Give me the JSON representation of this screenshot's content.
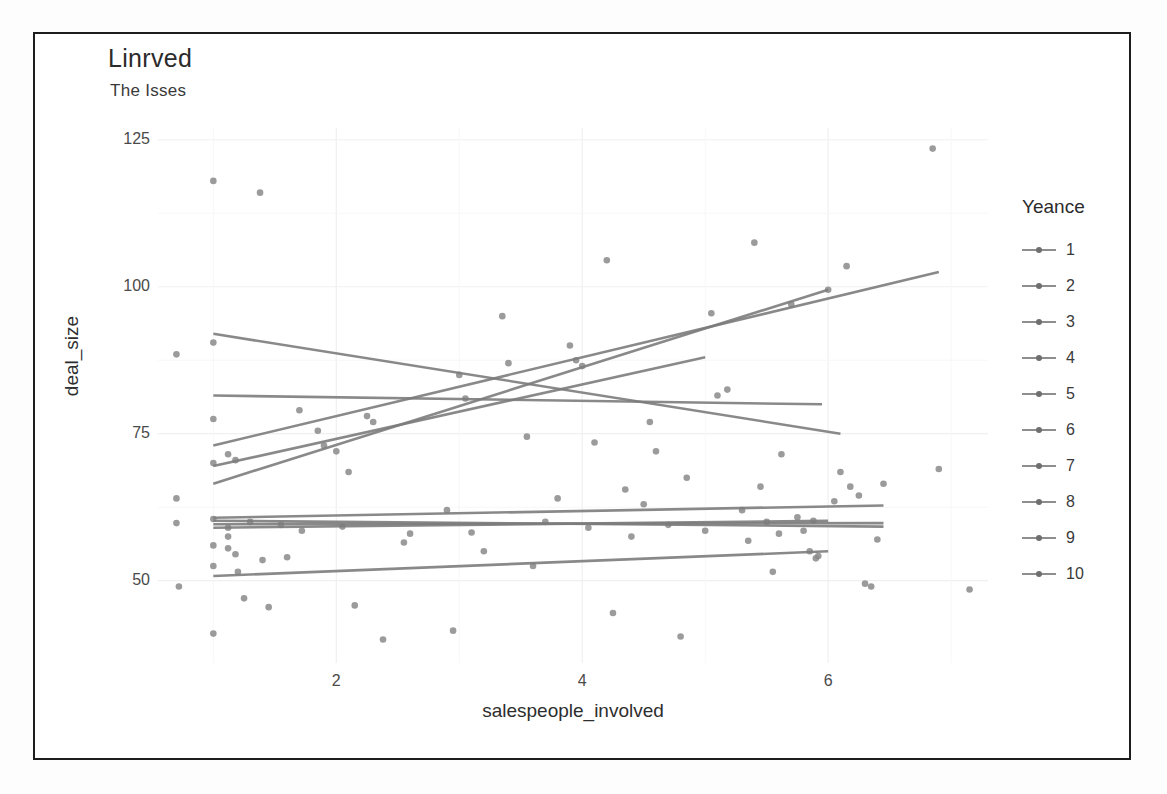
{
  "chart_data": {
    "type": "scatter",
    "title": "Linrved",
    "subtitle": "The Isses",
    "xlabel": "salespeople_involved",
    "ylabel": "deal_size",
    "xlim": [
      0.55,
      7.3
    ],
    "ylim": [
      36,
      127
    ],
    "xticks": [
      2,
      4,
      6
    ],
    "yticks": [
      50,
      75,
      100,
      125
    ],
    "grid": true,
    "legend_title": "Yeance",
    "legend_position": "right",
    "legend_entries": [
      "1",
      "2",
      "3",
      "4",
      "5",
      "6",
      "7",
      "8",
      "9",
      "10"
    ],
    "point_color": "#8a8a8a",
    "line_color": "#7c7c7c",
    "grid_color": "#f0f0f0",
    "panel_background": "#ffffff",
    "series": [
      {
        "name": "1",
        "fit": {
          "x0": 1.0,
          "y0": 92.0,
          "x1": 6.1,
          "y1": 75.0
        }
      },
      {
        "name": "2",
        "fit": {
          "x0": 1.0,
          "y0": 81.5,
          "x1": 5.95,
          "y1": 80.0
        }
      },
      {
        "name": "3",
        "fit": {
          "x0": 1.0,
          "y0": 73.0,
          "x1": 6.9,
          "y1": 102.5
        }
      },
      {
        "name": "4",
        "fit": {
          "x0": 1.0,
          "y0": 69.5,
          "x1": 5.0,
          "y1": 88.0
        }
      },
      {
        "name": "5",
        "fit": {
          "x0": 1.0,
          "y0": 66.5,
          "x1": 6.0,
          "y1": 99.5
        }
      },
      {
        "name": "6",
        "fit": {
          "x0": 1.0,
          "y0": 60.7,
          "x1": 6.45,
          "y1": 62.8
        }
      },
      {
        "name": "7",
        "fit": {
          "x0": 1.0,
          "y0": 60.2,
          "x1": 6.45,
          "y1": 59.2
        }
      },
      {
        "name": "8",
        "fit": {
          "x0": 1.0,
          "y0": 59.6,
          "x1": 6.45,
          "y1": 59.8
        }
      },
      {
        "name": "9",
        "fit": {
          "x0": 1.0,
          "y0": 59.0,
          "x1": 6.0,
          "y1": 60.2
        }
      },
      {
        "name": "10",
        "fit": {
          "x0": 1.0,
          "y0": 50.8,
          "x1": 6.0,
          "y1": 55.0
        }
      }
    ],
    "points": [
      [
        0.7,
        88.5
      ],
      [
        0.7,
        64.0
      ],
      [
        0.7,
        59.8
      ],
      [
        0.72,
        49.0
      ],
      [
        1.0,
        118.0
      ],
      [
        1.0,
        90.5
      ],
      [
        1.0,
        77.5
      ],
      [
        1.0,
        70.0
      ],
      [
        1.0,
        60.5
      ],
      [
        1.0,
        56.0
      ],
      [
        1.0,
        52.5
      ],
      [
        1.0,
        41.0
      ],
      [
        1.12,
        71.5
      ],
      [
        1.12,
        59.0
      ],
      [
        1.12,
        57.5
      ],
      [
        1.12,
        55.5
      ],
      [
        1.18,
        70.5
      ],
      [
        1.18,
        54.5
      ],
      [
        1.2,
        51.5
      ],
      [
        1.25,
        47.0
      ],
      [
        1.3,
        60.0
      ],
      [
        1.38,
        116.0
      ],
      [
        1.4,
        53.5
      ],
      [
        1.45,
        45.5
      ],
      [
        1.55,
        59.5
      ],
      [
        1.6,
        54.0
      ],
      [
        1.7,
        79.0
      ],
      [
        1.72,
        58.5
      ],
      [
        1.85,
        75.5
      ],
      [
        1.9,
        73.0
      ],
      [
        2.0,
        72.0
      ],
      [
        2.05,
        59.2
      ],
      [
        2.1,
        68.5
      ],
      [
        2.15,
        45.8
      ],
      [
        2.25,
        78.0
      ],
      [
        2.3,
        77.0
      ],
      [
        2.38,
        40.0
      ],
      [
        2.55,
        56.5
      ],
      [
        2.6,
        58.0
      ],
      [
        2.9,
        62.0
      ],
      [
        2.95,
        41.5
      ],
      [
        3.0,
        85.0
      ],
      [
        3.05,
        81.0
      ],
      [
        3.1,
        58.2
      ],
      [
        3.2,
        55.0
      ],
      [
        3.35,
        95.0
      ],
      [
        3.4,
        87.0
      ],
      [
        3.55,
        74.5
      ],
      [
        3.6,
        52.5
      ],
      [
        3.7,
        60.0
      ],
      [
        3.8,
        64.0
      ],
      [
        3.9,
        90.0
      ],
      [
        3.95,
        87.5
      ],
      [
        4.0,
        86.5
      ],
      [
        4.05,
        59.0
      ],
      [
        4.1,
        73.5
      ],
      [
        4.2,
        104.5
      ],
      [
        4.25,
        44.5
      ],
      [
        4.35,
        65.5
      ],
      [
        4.4,
        57.5
      ],
      [
        4.5,
        63.0
      ],
      [
        4.55,
        77.0
      ],
      [
        4.6,
        72.0
      ],
      [
        4.7,
        59.5
      ],
      [
        4.8,
        40.5
      ],
      [
        4.85,
        67.5
      ],
      [
        5.0,
        58.5
      ],
      [
        5.05,
        95.5
      ],
      [
        5.1,
        81.5
      ],
      [
        5.18,
        82.5
      ],
      [
        5.3,
        62.0
      ],
      [
        5.35,
        56.8
      ],
      [
        5.4,
        107.5
      ],
      [
        5.45,
        66.0
      ],
      [
        5.5,
        60.0
      ],
      [
        5.55,
        51.5
      ],
      [
        5.6,
        58.0
      ],
      [
        5.62,
        71.5
      ],
      [
        5.7,
        97.0
      ],
      [
        5.75,
        60.8
      ],
      [
        5.8,
        58.5
      ],
      [
        5.85,
        55.0
      ],
      [
        5.88,
        60.2
      ],
      [
        5.9,
        53.8
      ],
      [
        5.92,
        54.2
      ],
      [
        6.0,
        99.5
      ],
      [
        6.05,
        63.5
      ],
      [
        6.1,
        68.5
      ],
      [
        6.15,
        103.5
      ],
      [
        6.18,
        66.0
      ],
      [
        6.25,
        64.5
      ],
      [
        6.3,
        49.5
      ],
      [
        6.35,
        49.0
      ],
      [
        6.4,
        57.0
      ],
      [
        6.45,
        66.5
      ],
      [
        6.85,
        123.5
      ],
      [
        6.9,
        69.0
      ],
      [
        7.15,
        48.5
      ]
    ]
  }
}
